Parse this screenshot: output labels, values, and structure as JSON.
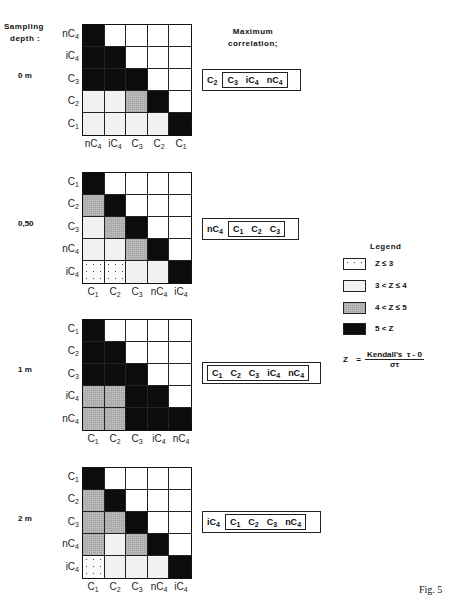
{
  "header": {
    "sampling_line1": "Sampling",
    "sampling_line2": "depth :",
    "maxcorr_line1": "Maximum",
    "maxcorr_line2": "correlation;"
  },
  "chart_data": {
    "type": "heatmap",
    "legend_levels": [
      {
        "code": 1,
        "label": "Z ≤ 3"
      },
      {
        "code": 2,
        "label": "3 < Z ≤ 4"
      },
      {
        "code": 3,
        "label": "4 < Z ≤ 5"
      },
      {
        "code": 4,
        "label": "5 < Z"
      }
    ],
    "note": "code 0 = upper triangle (blank)",
    "panels": [
      {
        "depth": "0 m",
        "rows": [
          "nC4",
          "iC4",
          "C3",
          "C2",
          "C1"
        ],
        "cols": [
          "nC4",
          "iC4",
          "C3",
          "C2",
          "C1"
        ],
        "matrix": [
          [
            4,
            0,
            0,
            0,
            0
          ],
          [
            4,
            4,
            0,
            0,
            0
          ],
          [
            4,
            4,
            4,
            0,
            0
          ],
          [
            2,
            2,
            3,
            4,
            0
          ],
          [
            2,
            2,
            2,
            2,
            4
          ]
        ],
        "max_correlation": {
          "outer": "C2",
          "inner": [
            "C3",
            "iC4",
            "nC4"
          ]
        }
      },
      {
        "depth": "0,50",
        "rows": [
          "C1",
          "C2",
          "C3",
          "nC4",
          "iC4"
        ],
        "cols": [
          "C1",
          "C2",
          "C3",
          "nC4",
          "iC4"
        ],
        "matrix": [
          [
            4,
            0,
            0,
            0,
            0
          ],
          [
            3,
            4,
            0,
            0,
            0
          ],
          [
            2,
            3,
            4,
            0,
            0
          ],
          [
            2,
            2,
            3,
            4,
            0
          ],
          [
            1,
            1,
            2,
            2,
            4
          ]
        ],
        "max_correlation": {
          "outer": "nC4",
          "inner": [
            "C1",
            "C2",
            "C3"
          ]
        }
      },
      {
        "depth": "1 m",
        "rows": [
          "C1",
          "C2",
          "C3",
          "iC4",
          "nC4"
        ],
        "cols": [
          "C1",
          "C2",
          "C3",
          "iC4",
          "nC4"
        ],
        "matrix": [
          [
            4,
            0,
            0,
            0,
            0
          ],
          [
            4,
            4,
            0,
            0,
            0
          ],
          [
            4,
            4,
            4,
            0,
            0
          ],
          [
            3,
            3,
            4,
            4,
            0
          ],
          [
            3,
            3,
            4,
            4,
            4
          ]
        ],
        "max_correlation": {
          "outer": "",
          "inner": [
            "C1",
            "C2",
            "C3",
            "iC4",
            "nC4"
          ]
        }
      },
      {
        "depth": "2 m",
        "rows": [
          "C1",
          "C2",
          "C3",
          "nC4",
          "iC4"
        ],
        "cols": [
          "C1",
          "C2",
          "C3",
          "nC4",
          "iC4"
        ],
        "matrix": [
          [
            4,
            0,
            0,
            0,
            0
          ],
          [
            3,
            4,
            0,
            0,
            0
          ],
          [
            3,
            3,
            4,
            0,
            0
          ],
          [
            3,
            2,
            3,
            4,
            0
          ],
          [
            1,
            2,
            2,
            2,
            4
          ]
        ],
        "max_correlation": {
          "outer": "iC4",
          "inner": [
            "C1",
            "C2",
            "C3",
            "nC4"
          ]
        }
      }
    ]
  },
  "legend": {
    "title": "Legend",
    "items": [
      "Z ≤ 3",
      "3 < Z ≤ 4",
      "4 < Z ≤ 5",
      "5 < Z"
    ]
  },
  "formula": {
    "lhs": "Z",
    "eq": "=",
    "numerator": "Kendall's  τ - 0",
    "denominator": "στ"
  },
  "figure_label": "Fig. 5"
}
